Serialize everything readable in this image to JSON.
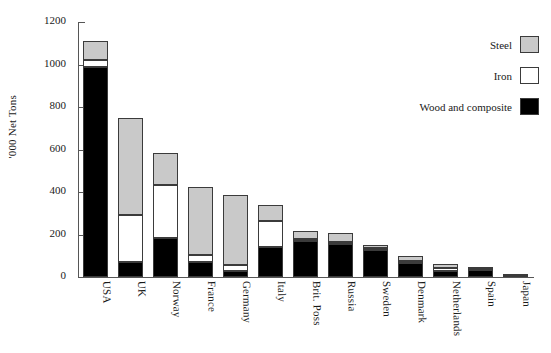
{
  "chart_data": {
    "type": "bar",
    "stacked": true,
    "title": "",
    "xlabel": "",
    "ylabel": "'000 Net Tons",
    "ylim": [
      0,
      1200
    ],
    "yticks": [
      0,
      200,
      400,
      600,
      800,
      1000,
      1200
    ],
    "ytick_labels": [
      "0",
      "200",
      "400",
      "600",
      "800",
      "1000",
      "1200"
    ],
    "grid": false,
    "legend_position": "top-right",
    "categories": [
      "USA",
      "UK",
      "Norway",
      "France",
      "Germany",
      "Italy",
      "Brit. Poss",
      "Russia",
      "Sweden",
      "Denmark",
      "Netherlands",
      "Spain",
      "Japan"
    ],
    "series": [
      {
        "name": "Wood and composite",
        "color": "#000000",
        "values": [
          990,
          70,
          185,
          70,
          30,
          140,
          170,
          155,
          125,
          65,
          30,
          33,
          4
        ]
      },
      {
        "name": "Iron",
        "color": "#ffffff",
        "values": [
          30,
          220,
          250,
          35,
          25,
          125,
          10,
          12,
          10,
          10,
          13,
          4,
          1
        ]
      },
      {
        "name": "Steel",
        "color": "#c9c9c9",
        "values": [
          90,
          460,
          150,
          320,
          330,
          72,
          37,
          38,
          15,
          24,
          18,
          5,
          1
        ]
      }
    ],
    "totals": [
      1110,
      750,
      585,
      425,
      385,
      337,
      217,
      205,
      150,
      99,
      61,
      42,
      6
    ]
  },
  "legend": {
    "items": [
      {
        "label": "Steel",
        "swatch": "steel-swatch",
        "color": "#c9c9c9"
      },
      {
        "label": "Iron",
        "swatch": "iron-swatch",
        "color": "#ffffff"
      },
      {
        "label": "Wood and composite",
        "swatch": "wood-swatch",
        "color": "#000000"
      }
    ]
  }
}
